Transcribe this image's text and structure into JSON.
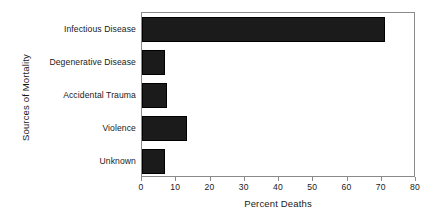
{
  "chart_data": {
    "type": "bar",
    "orientation": "horizontal",
    "title": "",
    "xlabel": "Percent Deaths",
    "ylabel": "Sources of Mortality",
    "categories": [
      "Infectious Disease",
      "Degenerative Disease",
      "Accidental Trauma",
      "Violence",
      "Unknown"
    ],
    "values": [
      71,
      6.7,
      7.3,
      13,
      6.7
    ],
    "xlim": [
      0,
      80
    ],
    "xticks": [
      0,
      10,
      20,
      30,
      40,
      50,
      60,
      70,
      80
    ],
    "xtick_labels": [
      "0",
      "10",
      "20",
      "30",
      "40",
      "50",
      "60",
      "70",
      "80"
    ],
    "grid": false,
    "legend": false,
    "bar_color": "#1b1b1b",
    "frame_color": "#8a8a8a",
    "background": "#ffffff"
  }
}
